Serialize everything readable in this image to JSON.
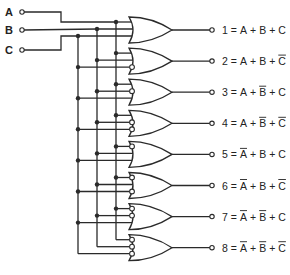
{
  "inputs": [
    {
      "name": "A",
      "y": 12
    },
    {
      "name": "B",
      "y": 30
    },
    {
      "name": "C",
      "y": 50
    }
  ],
  "buses": {
    "A": 116,
    "B": 97,
    "C": 78
  },
  "gate_type": "OR",
  "outputs": [
    {
      "index": "1",
      "terms": [
        {
          "v": "A",
          "inv": false
        },
        {
          "v": "B",
          "inv": false
        },
        {
          "v": "C",
          "inv": false
        }
      ]
    },
    {
      "index": "2",
      "terms": [
        {
          "v": "A",
          "inv": false
        },
        {
          "v": "B",
          "inv": false
        },
        {
          "v": "C",
          "inv": true
        }
      ]
    },
    {
      "index": "3",
      "terms": [
        {
          "v": "A",
          "inv": false
        },
        {
          "v": "B",
          "inv": true
        },
        {
          "v": "C",
          "inv": false
        }
      ]
    },
    {
      "index": "4",
      "terms": [
        {
          "v": "A",
          "inv": false
        },
        {
          "v": "B",
          "inv": true
        },
        {
          "v": "C",
          "inv": true
        }
      ]
    },
    {
      "index": "5",
      "terms": [
        {
          "v": "A",
          "inv": true
        },
        {
          "v": "B",
          "inv": false
        },
        {
          "v": "C",
          "inv": false
        }
      ]
    },
    {
      "index": "6",
      "terms": [
        {
          "v": "A",
          "inv": true
        },
        {
          "v": "B",
          "inv": false
        },
        {
          "v": "C",
          "inv": true
        }
      ]
    },
    {
      "index": "7",
      "terms": [
        {
          "v": "A",
          "inv": true
        },
        {
          "v": "B",
          "inv": true
        },
        {
          "v": "C",
          "inv": false
        }
      ]
    },
    {
      "index": "8",
      "terms": [
        {
          "v": "A",
          "inv": true
        },
        {
          "v": "B",
          "inv": true
        },
        {
          "v": "C",
          "inv": true
        }
      ]
    }
  ],
  "labels": {
    "equals": "=",
    "plus": "+"
  },
  "colors": {
    "ink": "#2a2a2a",
    "background": "#ffffff"
  }
}
